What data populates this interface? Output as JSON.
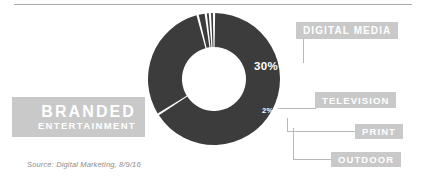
{
  "chart_data": {
    "type": "pie",
    "variant": "donut",
    "title": "",
    "categories": [
      "Branded Entertainment",
      "Digital Media",
      "Television",
      "Print",
      "Outdoor"
    ],
    "values": [
      66,
      30,
      2,
      1,
      1
    ],
    "value_labels": [
      "66%",
      "30%",
      "2%",
      "1%",
      "1%"
    ],
    "unit": "%",
    "total": 100,
    "legend": "callout-labels",
    "grid": false,
    "start_angle_deg": 0,
    "direction": "clockwise",
    "colors": {
      "slice": "#3c3c3c",
      "label_chip": "#c9c9c9",
      "label_text": "#ffffff",
      "leader_line": "#b9b9b9",
      "background": "#ffffff",
      "source_text": "#8c8c8c",
      "top_rule": "#a9a9a9"
    },
    "annotations": [
      {
        "label": "DIGITAL MEDIA",
        "value": "30%"
      },
      {
        "label": "TELEVISION",
        "value": "2%"
      },
      {
        "label": "PRINT",
        "value": "1%"
      },
      {
        "label": "OUTDOOR",
        "value": "1%"
      },
      {
        "label": "BRANDED ENTERTAINMENT",
        "value": "66%"
      }
    ]
  },
  "labels": {
    "digital_media": "DIGITAL MEDIA",
    "television": "TELEVISION",
    "print": "PRINT",
    "outdoor": "OUTDOOR",
    "branded_line1": "BRANDED",
    "branded_line2": "ENTERTAINMENT"
  },
  "percentages": {
    "digital_media": "30%",
    "television": "2%",
    "print": "1%",
    "outdoor": "1%",
    "branded_entertainment": "66%"
  },
  "source": "Source: Digital Marketing, 8/9/16"
}
